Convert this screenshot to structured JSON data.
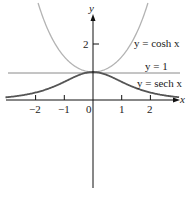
{
  "chart_data": {
    "type": "line",
    "title": "",
    "xlabel": "x",
    "ylabel": "y",
    "xlim": [
      -3,
      3
    ],
    "ylim": [
      -3,
      3.5
    ],
    "x_ticks": [
      "-2",
      "-1",
      "0",
      "1",
      "2"
    ],
    "y_ticks": [
      "2"
    ],
    "grid": false,
    "series": [
      {
        "name": "y = cosh x",
        "function": "cosh(x)",
        "color": "#b3b3b3",
        "x": [
          -1.9,
          -1.5,
          -1,
          -0.5,
          0,
          0.5,
          1,
          1.5,
          1.9
        ],
        "values": [
          3.42,
          2.35,
          1.54,
          1.13,
          1.0,
          1.13,
          1.54,
          2.35,
          3.42
        ]
      },
      {
        "name": "y = 1",
        "function": "1",
        "color": "#8a8a8a",
        "x": [
          -3,
          3
        ],
        "values": [
          1,
          1
        ]
      },
      {
        "name": "y = sech x",
        "function": "sech(x)",
        "color": "#555555",
        "x": [
          -3,
          -2,
          -1,
          -0.5,
          0,
          0.5,
          1,
          2,
          3
        ],
        "values": [
          0.099,
          0.266,
          0.648,
          0.887,
          1.0,
          0.887,
          0.648,
          0.266,
          0.099
        ]
      }
    ],
    "annotations": [
      {
        "text": "y = cosh x",
        "position": "upper right"
      },
      {
        "text": "y = 1",
        "position": "right, above line y=1"
      },
      {
        "text": "y = sech x",
        "position": "right, below line y=1"
      }
    ]
  },
  "labels": {
    "x_axis": "x",
    "y_axis": "y",
    "cosh": "y = cosh x",
    "one": "y = 1",
    "sech": "y = sech x",
    "tick_m2": "−2",
    "tick_m1": "−1",
    "tick_0": "0",
    "tick_1": "1",
    "tick_2": "2",
    "ytick_2": "2"
  }
}
